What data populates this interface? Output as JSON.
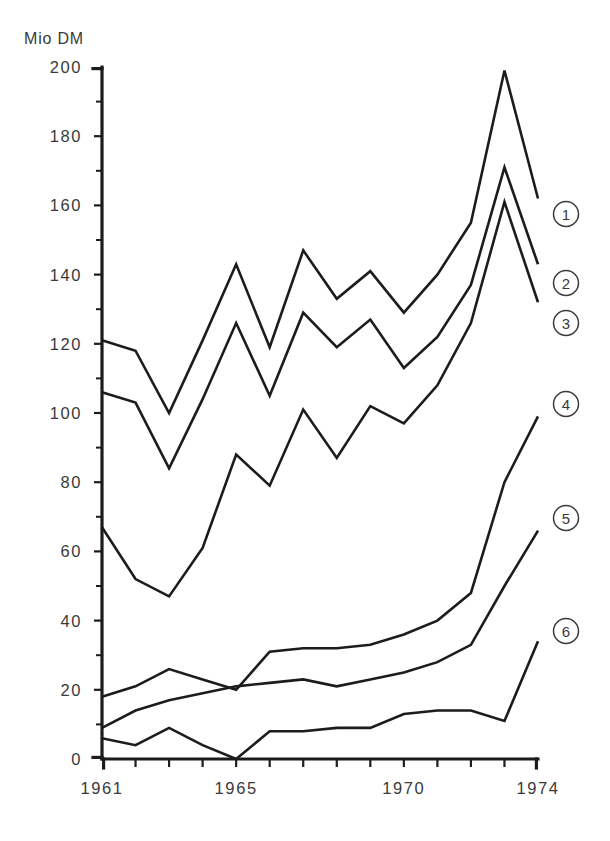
{
  "chart_data": {
    "type": "line",
    "title": "",
    "subtitle": "",
    "xlabel": "",
    "ylabel": "Mio DM",
    "unit_label": "Mio DM",
    "xlim": [
      1961,
      1974
    ],
    "ylim": [
      0,
      200
    ],
    "y_tick_step": 20,
    "y_minor_step": 10,
    "x_tick_step": 1,
    "grid": false,
    "legend_position": "right",
    "x": [
      1961,
      1962,
      1963,
      1964,
      1965,
      1966,
      1967,
      1968,
      1969,
      1970,
      1971,
      1972,
      1973,
      1974
    ],
    "x_tick_labels": [
      "1961",
      "",
      "",
      "",
      "1965",
      "",
      "",
      "",
      "",
      "1970",
      "",
      "",
      "",
      "1974"
    ],
    "y_tick_labels": [
      "0",
      "20",
      "40",
      "60",
      "80",
      "100",
      "120",
      "140",
      "160",
      "180",
      "200"
    ],
    "y_tick_values": [
      0,
      20,
      40,
      60,
      80,
      100,
      120,
      140,
      160,
      180,
      200
    ],
    "series": [
      {
        "name": "1",
        "legend_label": "1",
        "values": [
          121,
          118,
          100,
          121,
          143,
          119,
          147,
          133,
          141,
          129,
          140,
          155,
          199,
          162
        ]
      },
      {
        "name": "2",
        "legend_label": "2",
        "values": [
          106,
          103,
          84,
          104,
          126,
          105,
          129,
          119,
          127,
          113,
          122,
          137,
          171,
          143
        ]
      },
      {
        "name": "3",
        "legend_label": "3",
        "values": [
          67,
          52,
          47,
          61,
          88,
          79,
          101,
          87,
          102,
          97,
          108,
          126,
          161,
          132
        ]
      },
      {
        "name": "4",
        "legend_label": "4",
        "values": [
          18,
          21,
          26,
          23,
          20,
          31,
          32,
          32,
          33,
          36,
          40,
          48,
          80,
          99
        ]
      },
      {
        "name": "5",
        "legend_label": "5",
        "values": [
          9,
          14,
          17,
          19,
          21,
          22,
          23,
          21,
          23,
          25,
          28,
          33,
          50,
          66
        ]
      },
      {
        "name": "6",
        "legend_label": "6",
        "values": [
          6,
          4,
          9,
          4,
          0,
          8,
          8,
          9,
          9,
          13,
          14,
          14,
          11,
          34
        ]
      }
    ],
    "legend_entries": [
      {
        "label": "1",
        "value_at_end": 162
      },
      {
        "label": "2",
        "value_at_end": 143
      },
      {
        "label": "3",
        "value_at_end": 132
      },
      {
        "label": "4",
        "value_at_end": 99
      },
      {
        "label": "5",
        "value_at_end": 66
      },
      {
        "label": "6",
        "value_at_end": 34
      }
    ]
  },
  "plot": {
    "left_px": 102,
    "right_px": 538,
    "top_px": 67,
    "bottom_px": 759,
    "legend_x_px": 566
  }
}
